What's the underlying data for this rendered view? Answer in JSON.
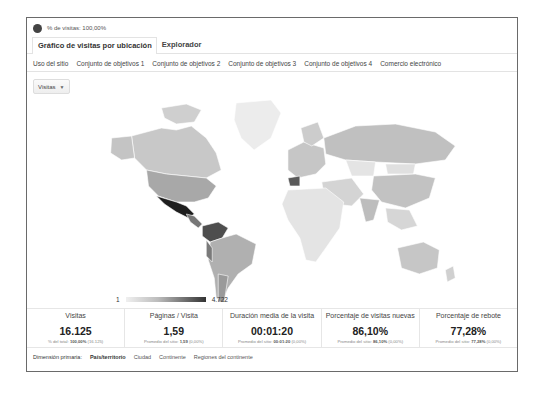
{
  "segment": {
    "icon": "pie-segment-icon",
    "label": "% de visitas: 100,00%"
  },
  "tabs": [
    {
      "label": "Gráfico de visitas por ubicación",
      "active": true
    },
    {
      "label": "Explorador",
      "active": false
    }
  ],
  "subtabs": [
    {
      "label": "Uso del sitio"
    },
    {
      "label": "Conjunto de objetivos 1"
    },
    {
      "label": "Conjunto de objetivos 2"
    },
    {
      "label": "Conjunto de objetivos 3"
    },
    {
      "label": "Conjunto de objetivos 4"
    },
    {
      "label": "Comercio electrónico"
    }
  ],
  "metric_select": {
    "value": "Visitas",
    "icon": "caret-down-icon"
  },
  "map": {
    "highlight_colors": {
      "max": "#1e1e1e",
      "high": "#555555",
      "mid": "#8a8a8a",
      "low": "#c4c4c4",
      "none": "#eaeaea",
      "border": "#ffffff"
    },
    "legend": {
      "min": "1",
      "max": "4.722"
    }
  },
  "metrics": [
    {
      "label": "Visitas",
      "value": "16.125",
      "sub_prefix": "% del total: ",
      "sub_bold": "100,00%",
      "sub_suffix": " (16.125)"
    },
    {
      "label": "Páginas / Visita",
      "value": "1,59",
      "sub_prefix": "Promedio del sitio: ",
      "sub_bold": "1,59",
      "sub_suffix": " (0,00%)"
    },
    {
      "label": "Duración media de la visita",
      "value": "00:01:20",
      "sub_prefix": "Promedio del sitio: ",
      "sub_bold": "00:01:20",
      "sub_suffix": " (0,00%)"
    },
    {
      "label": "Porcentaje de visitas nuevas",
      "value": "86,10%",
      "sub_prefix": "Promedio del sitio: ",
      "sub_bold": "86,10%",
      "sub_suffix": " (0,00%)"
    },
    {
      "label": "Porcentaje de rebote",
      "value": "77,28%",
      "sub_prefix": "Promedio del sitio: ",
      "sub_bold": "77,28%",
      "sub_suffix": " (0,00%)"
    }
  ],
  "dimension": {
    "label": "Dimensión primaria:",
    "options": [
      {
        "label": "País/territorio",
        "active": true
      },
      {
        "label": "Ciudad",
        "active": false
      },
      {
        "label": "Continente",
        "active": false
      },
      {
        "label": "Regiones del continente",
        "active": false
      }
    ]
  }
}
